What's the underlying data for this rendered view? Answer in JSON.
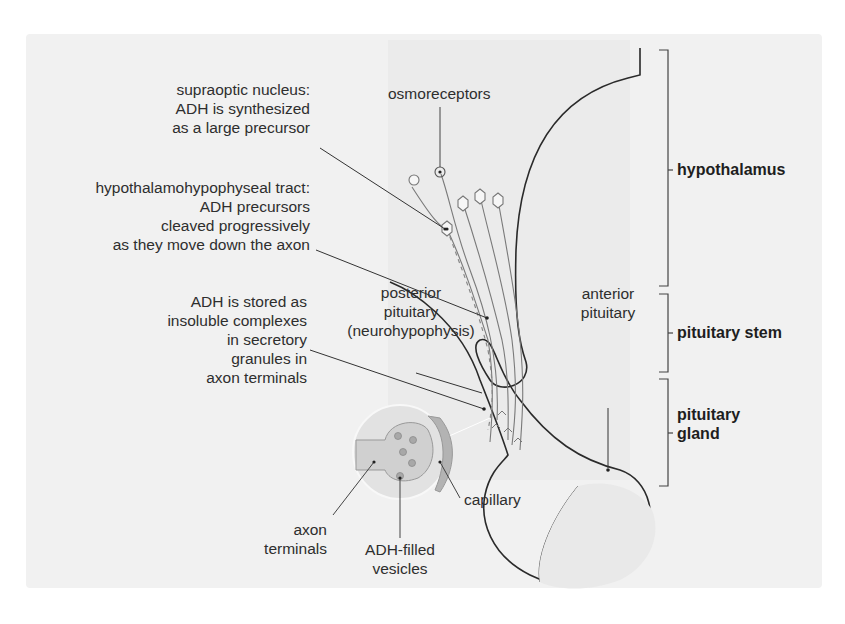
{
  "figure": {
    "colors": {
      "panel_bg": "#f1f1f1",
      "shade_bg": "#ebebeb",
      "outline": "#2a2a2a",
      "neuron": "#7a7a7a",
      "inset_fill": "#d6d6d6",
      "terminal_fill": "#c8c8c8",
      "vesicle_fill": "#a9a9a9",
      "capillary_fill": "#b5b5b5"
    }
  },
  "labels": {
    "osmoreceptors": "osmoreceptors",
    "supraoptic": [
      "supraoptic nucleus:",
      "ADH is synthesized",
      "as a large precursor"
    ],
    "tract": [
      "hypothalamohypophyseal tract:",
      "ADH precursors",
      "cleaved progressively",
      "as they move down the axon"
    ],
    "stored": [
      "ADH is stored as",
      "insoluble complexes",
      "in secretory",
      "granules in",
      "axon terminals"
    ],
    "posterior": [
      "posterior",
      "pituitary",
      "(neurohypophysis)"
    ],
    "anterior": [
      "anterior",
      "pituitary"
    ],
    "axon_terminals": [
      "axon",
      "terminals"
    ],
    "vesicles": [
      "ADH-filled",
      "vesicles"
    ],
    "capillary": "capillary"
  },
  "regions": {
    "hypothalamus": "hypothalamus",
    "stem": "pituitary stem",
    "gland": [
      "pituitary",
      "gland"
    ]
  }
}
